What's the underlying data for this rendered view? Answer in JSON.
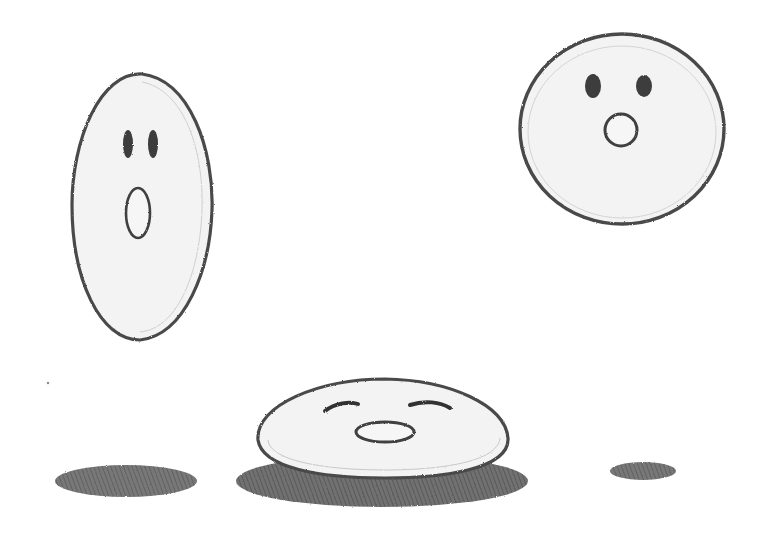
{
  "scene": {
    "description": "Pencil sketch of a bouncing ball with a face: stretched, squashed, and round poses with cast shadows",
    "colors": {
      "paper": "#ffffff",
      "ball_fill": "#f3f3f3",
      "outline": "#4a4a4a",
      "eyes": "#3c3c3c",
      "shadow": "#5c5c5c"
    },
    "characters": [
      {
        "pose": "stretched",
        "expression": "surprised",
        "mouth": "open-oval"
      },
      {
        "pose": "squashed",
        "expression": "happy",
        "eyes": "closed-arcs",
        "mouth": "flat-oval"
      },
      {
        "pose": "round",
        "expression": "surprised",
        "mouth": "small-o"
      }
    ],
    "shadows": [
      "left-large",
      "center-under-squash",
      "right-small"
    ]
  }
}
